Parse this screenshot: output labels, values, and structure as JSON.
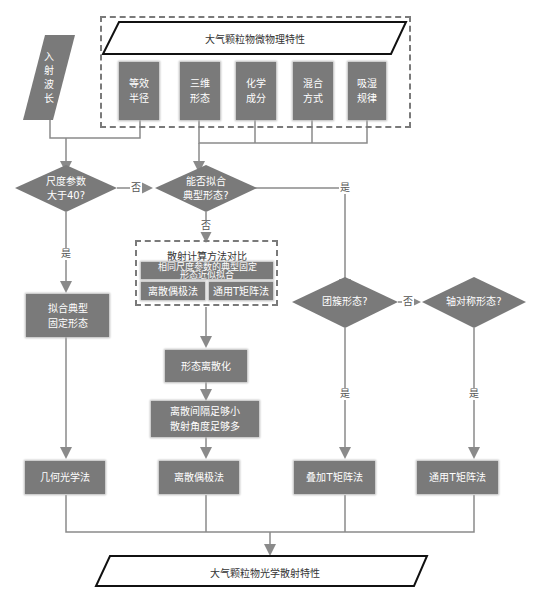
{
  "diagram": {
    "input_wavelength": {
      "label": "入\n射\n波\n长"
    },
    "micro_group": {
      "title": "大气颗粒物微物理特性",
      "items": [
        {
          "label": "等效\n半径"
        },
        {
          "label": "三维\n形态"
        },
        {
          "label": "化学\n成分"
        },
        {
          "label": "混合\n方式"
        },
        {
          "label": "吸湿\n规律"
        }
      ]
    },
    "decisions": {
      "size_param": "尺度参数\n大于40?",
      "fit_typical": "能否拟合\n典型形态?",
      "cluster": "团簇形态?",
      "axisymmetric": "轴对称形态?"
    },
    "edge_labels": {
      "no": "否",
      "yes": "是"
    },
    "comparison_group": {
      "title": "散射计算方法对比",
      "approx": "相同尺度参数的典型固定\n形态近似拟合",
      "dda": "离散偶极法",
      "tmatrix": "通用T矩阵法"
    },
    "steps": {
      "fit_fixed": "拟合典型\n固定形态",
      "discretize": "形态离散化",
      "discrete_condition": "离散间隔足够小\n散射角度足够多"
    },
    "methods": [
      {
        "label": "几何光学法"
      },
      {
        "label": "离散偶极法"
      },
      {
        "label": "叠加T矩阵法"
      },
      {
        "label": "通用T矩阵法"
      }
    ],
    "output": {
      "label": "大气颗粒物光学散射特性"
    }
  },
  "colors": {
    "node_fill": "#7a7a7a",
    "line": "#8a8a8a",
    "text_on_node": "#ffffff"
  }
}
